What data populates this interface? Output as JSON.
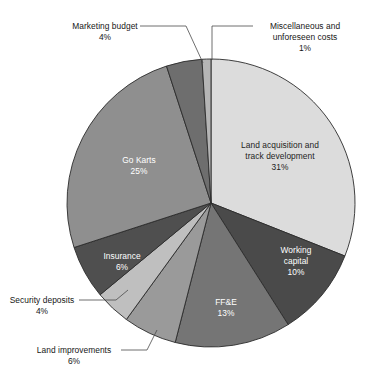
{
  "chart_data": {
    "type": "pie",
    "title": "",
    "subtitle": "",
    "xlabel": "",
    "ylabel": "",
    "legend_position": "none",
    "grid": false,
    "units": "percent",
    "start_angle_deg": 0,
    "direction": "clockwise",
    "categories": [
      "Land acquisition and track development",
      "Working capital",
      "FF&E",
      "Land improvements",
      "Security deposits",
      "Insurance",
      "Go Karts",
      "Marketing budget",
      "Miscellaneous and unforeseen costs"
    ],
    "values": [
      31,
      10,
      13,
      6,
      4,
      6,
      25,
      4,
      1
    ],
    "slices": [
      {
        "label_line1": "Land acquisition and",
        "label_line2": "track development",
        "value_text": "31%",
        "value": 31,
        "color": "#dcdcdc",
        "label_placement": "inside",
        "label_color": "#1c1c1c"
      },
      {
        "label_line1": "Working",
        "label_line2": "capital",
        "value_text": "10%",
        "value": 10,
        "color": "#4a4a4a",
        "label_placement": "inside",
        "label_color": "#ffffff"
      },
      {
        "label_line1": "FF&E",
        "label_line2": "",
        "value_text": "13%",
        "value": 13,
        "color": "#757575",
        "label_placement": "inside",
        "label_color": "#ffffff"
      },
      {
        "label_line1": "Land improvements",
        "label_line2": "",
        "value_text": "6%",
        "value": 6,
        "color": "#9a9a9a",
        "label_placement": "outside",
        "label_color": "#161616"
      },
      {
        "label_line1": "Security deposits",
        "label_line2": "",
        "value_text": "4%",
        "value": 4,
        "color": "#bfbfbf",
        "label_placement": "outside",
        "label_color": "#161616"
      },
      {
        "label_line1": "Insurance",
        "label_line2": "",
        "value_text": "6%",
        "value": 6,
        "color": "#4f4f4f",
        "label_placement": "inside",
        "label_color": "#ffffff"
      },
      {
        "label_line1": "Go Karts",
        "label_line2": "",
        "value_text": "25%",
        "value": 25,
        "color": "#8f8f8f",
        "label_placement": "inside",
        "label_color": "#ffffff"
      },
      {
        "label_line1": "Marketing budget",
        "label_line2": "",
        "value_text": "4%",
        "value": 4,
        "color": "#6e6e6e",
        "label_placement": "outside",
        "label_color": "#161616"
      },
      {
        "label_line1": "Miscellaneous and",
        "label_line2": "unforeseen costs",
        "value_text": "1%",
        "value": 1,
        "color": "#b5b5b5",
        "label_placement": "outside",
        "label_color": "#161616"
      }
    ]
  },
  "labels": {
    "land_acquisition": {
      "line1": "Land acquisition and",
      "line2": "track development",
      "pct": "31%"
    },
    "working_capital": {
      "line1": "Working",
      "line2": "capital",
      "pct": "10%"
    },
    "ffe": {
      "line1": "FF&E",
      "pct": "13%"
    },
    "land_improvements": {
      "line1": "Land improvements",
      "pct": "6%"
    },
    "security_deposits": {
      "line1": "Security deposits",
      "pct": "4%"
    },
    "insurance": {
      "line1": "Insurance",
      "pct": "6%"
    },
    "go_karts": {
      "line1": "Go Karts",
      "pct": "25%"
    },
    "marketing_budget": {
      "line1": "Marketing budget",
      "pct": "4%"
    },
    "miscellaneous": {
      "line1": "Miscellaneous and",
      "line2": "unforeseen costs",
      "pct": "1%"
    }
  }
}
